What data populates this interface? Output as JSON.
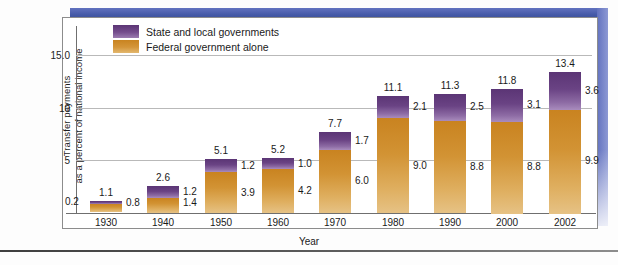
{
  "chart_data": {
    "type": "bar",
    "subtype": "stacked-vertical",
    "title": "",
    "xlabel": "Year",
    "ylabel": "Transfer payments as a percent of national income",
    "ylabel_lines": [
      "Transfer payments",
      "as a percent of national income"
    ],
    "categories": [
      "1930",
      "1940",
      "1950",
      "1960",
      "1970",
      "1980",
      "1990",
      "2000",
      "2002"
    ],
    "series": [
      {
        "name": "Federal government alone",
        "color": "#c98320",
        "values": [
          0.8,
          1.4,
          3.9,
          4.2,
          6.0,
          9.0,
          8.8,
          8.8,
          9.9
        ]
      },
      {
        "name": "State and local governments",
        "color": "#5b3575",
        "values": [
          0.2,
          1.2,
          1.2,
          1.0,
          1.7,
          2.1,
          2.5,
          3.1,
          3.6
        ]
      }
    ],
    "totals": [
      1.1,
      2.6,
      5.1,
      5.2,
      7.7,
      11.1,
      11.3,
      11.8,
      13.4
    ],
    "ylim": [
      0,
      17.8
    ],
    "yticks": [
      {
        "value": 15.0,
        "label": "15.0"
      },
      {
        "value": 10.0,
        "label": "10"
      },
      {
        "value": 5.0,
        "label": "5"
      }
    ],
    "grid": true,
    "legend_position": "top-left",
    "note_first_bar_state_label_side": "left"
  },
  "legend": {
    "items": [
      {
        "label": "State and local governments",
        "color": "#5b3575",
        "icon": "legend-swatch-state"
      },
      {
        "label": "Federal government alone",
        "color": "#c98320",
        "icon": "legend-swatch-federal"
      }
    ]
  },
  "axis": {
    "x_title": "Year",
    "y_title_line1": "Transfer payments",
    "y_title_line2": "as a percent of national income"
  },
  "colors": {
    "state_local": "#5b3575",
    "federal": "#c98320",
    "frame_blue": "#4a5bb0",
    "gridline": "#b9b9b9",
    "axis": "#6f6f6f"
  }
}
